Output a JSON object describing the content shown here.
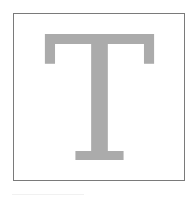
{
  "tile": {
    "letter": "T",
    "letter_color": "#ababab",
    "border_color": "#7a7a7a",
    "background": "#ffffff"
  }
}
